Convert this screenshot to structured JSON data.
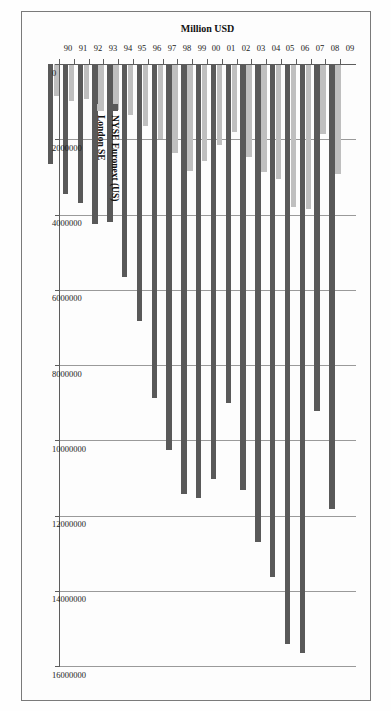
{
  "chart_data": {
    "type": "bar",
    "orientation": "horizontal",
    "title": "",
    "xlabel": "Million USD",
    "ylabel": "",
    "axis_title": "Million USD",
    "categories": [
      "90",
      "91",
      "92",
      "93",
      "94",
      "95",
      "96",
      "97",
      "98",
      "99",
      "00",
      "01",
      "02",
      "03",
      "04",
      "05",
      "06",
      "07",
      "08",
      "09"
    ],
    "xlim": [
      0,
      16000000
    ],
    "tick_labels": [
      "0",
      "2000000",
      "4000000",
      "6000000",
      "8000000",
      "10000000",
      "12000000",
      "14000000",
      "16000000"
    ],
    "tick_values": [
      0,
      2000000,
      4000000,
      6000000,
      8000000,
      10000000,
      12000000,
      14000000,
      16000000
    ],
    "grid": true,
    "legend_position": "inside-left",
    "series": [
      {
        "name": "NYSE Euronext (US)",
        "color": "#595959",
        "values": [
          2650000,
          3450000,
          3700000,
          4250000,
          4200000,
          5650000,
          6840000,
          8880000,
          10270000,
          11440000,
          11530000,
          11020000,
          9010000,
          11330000,
          12700000,
          13630000,
          15420000,
          15650000,
          9210000,
          11830000
        ]
      },
      {
        "name": "London SE",
        "color": "#bfbfbf",
        "values": [
          850000,
          980000,
          930000,
          1150000,
          1210000,
          1350000,
          1640000,
          1990000,
          2370000,
          2850000,
          2580000,
          2150000,
          1800000,
          2460000,
          2865000,
          3060000,
          3790000,
          3850000,
          1870000,
          2930000
        ]
      }
    ]
  },
  "legend": {
    "entries": [
      {
        "label": "NYSE Euronext (US)",
        "swatch": "dark-gray-swatch"
      },
      {
        "label": "London SE",
        "swatch": "light-gray-swatch"
      }
    ]
  }
}
